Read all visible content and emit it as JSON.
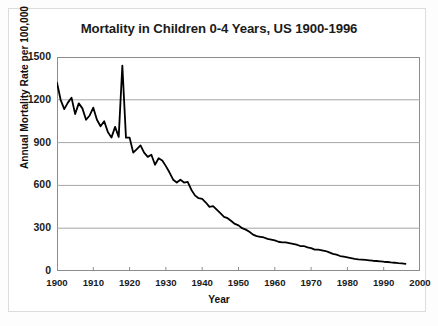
{
  "chart_data": {
    "type": "line",
    "title": "Mortality in Children 0-4 Years, US 1900-1996",
    "xlabel": "Year",
    "ylabel": "Annual Mortality Rate per 100,000",
    "xlim": [
      1900,
      2000
    ],
    "ylim": [
      0,
      1500
    ],
    "xticks": [
      1900,
      1910,
      1920,
      1930,
      1940,
      1950,
      1960,
      1970,
      1980,
      1990,
      2000
    ],
    "yticks": [
      0,
      300,
      600,
      900,
      1200,
      1500
    ],
    "grid": "horizontal",
    "legend": "none",
    "line_color": "#000000",
    "series": [
      {
        "name": "Annual Mortality Rate per 100,000",
        "x": [
          1900,
          1901,
          1902,
          1903,
          1904,
          1905,
          1906,
          1907,
          1908,
          1909,
          1910,
          1911,
          1912,
          1913,
          1914,
          1915,
          1916,
          1917,
          1918,
          1919,
          1920,
          1921,
          1922,
          1923,
          1924,
          1925,
          1926,
          1927,
          1928,
          1929,
          1930,
          1931,
          1932,
          1933,
          1934,
          1935,
          1936,
          1937,
          1938,
          1939,
          1940,
          1941,
          1942,
          1943,
          1944,
          1945,
          1946,
          1947,
          1948,
          1949,
          1950,
          1951,
          1952,
          1953,
          1954,
          1955,
          1956,
          1957,
          1958,
          1959,
          1960,
          1961,
          1962,
          1963,
          1964,
          1965,
          1966,
          1967,
          1968,
          1969,
          1970,
          1971,
          1972,
          1973,
          1974,
          1975,
          1976,
          1977,
          1978,
          1979,
          1980,
          1981,
          1982,
          1983,
          1984,
          1985,
          1986,
          1987,
          1988,
          1989,
          1990,
          1991,
          1992,
          1993,
          1994,
          1995,
          1996
        ],
        "values": [
          1320,
          1200,
          1135,
          1180,
          1215,
          1100,
          1175,
          1140,
          1060,
          1090,
          1145,
          1060,
          1015,
          1050,
          975,
          935,
          1010,
          940,
          1440,
          935,
          935,
          830,
          855,
          880,
          830,
          800,
          815,
          745,
          790,
          775,
          735,
          690,
          640,
          620,
          640,
          620,
          625,
          570,
          530,
          510,
          505,
          480,
          450,
          455,
          430,
          405,
          380,
          370,
          350,
          330,
          320,
          300,
          290,
          275,
          255,
          245,
          240,
          235,
          225,
          220,
          215,
          205,
          200,
          200,
          195,
          190,
          185,
          175,
          175,
          165,
          160,
          150,
          150,
          145,
          140,
          130,
          120,
          115,
          105,
          100,
          95,
          90,
          85,
          82,
          80,
          78,
          75,
          72,
          70,
          68,
          65,
          63,
          60,
          58,
          55,
          53,
          50
        ]
      }
    ]
  }
}
